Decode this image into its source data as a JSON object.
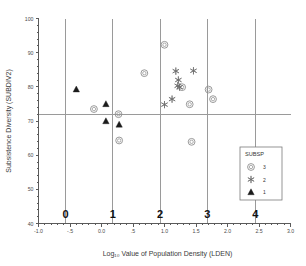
{
  "chart_data": {
    "type": "scatter",
    "title": "",
    "xlabel": "Log₁₀ Value of Population Density (LDEN)",
    "ylabel": "Subsistence Diversity (SUBDIV2)",
    "xlim": [
      -1.0,
      3.0
    ],
    "ylim": [
      40,
      100
    ],
    "grid": false,
    "xticklabels": [
      "-1.0",
      "-.5",
      "0.0",
      ".5",
      "1.0",
      "1.5",
      "2.0",
      "2.5",
      "3.0"
    ],
    "xtickvalues": [
      -1.0,
      -0.5,
      0.0,
      0.5,
      1.0,
      1.5,
      2.0,
      2.5,
      3.0
    ],
    "yticklabels": [
      "40",
      "50",
      "60",
      "70",
      "80",
      "90",
      "100"
    ],
    "ytickvalues": [
      40,
      50,
      60,
      70,
      80,
      90,
      100
    ],
    "reference_lines": {
      "horizontal": [
        72
      ],
      "vertical": [
        -0.57,
        0.18,
        0.93,
        1.68,
        2.44
      ]
    },
    "group_labels": [
      {
        "text": "0",
        "x": -0.57
      },
      {
        "text": "1",
        "x": 0.18
      },
      {
        "text": "2",
        "x": 0.93
      },
      {
        "text": "3",
        "x": 1.68
      },
      {
        "text": "4",
        "x": 2.44
      }
    ],
    "legend": {
      "title": "SUBSP",
      "position": "bottom-right",
      "entries": [
        {
          "label": "3",
          "marker": "circle"
        },
        {
          "label": "2",
          "marker": "asterisk"
        },
        {
          "label": "1",
          "marker": "triangle"
        }
      ]
    },
    "series": [
      {
        "name": "3",
        "marker": "circle",
        "color": "#8e8e8e",
        "points": [
          {
            "x": -0.12,
            "y": 73.5
          },
          {
            "x": 0.27,
            "y": 72.0
          },
          {
            "x": 0.28,
            "y": 64.3
          },
          {
            "x": 0.68,
            "y": 84.0
          },
          {
            "x": 1.0,
            "y": 92.3
          },
          {
            "x": 1.28,
            "y": 79.9
          },
          {
            "x": 1.4,
            "y": 74.9
          },
          {
            "x": 1.43,
            "y": 63.9
          },
          {
            "x": 1.7,
            "y": 79.2
          },
          {
            "x": 1.77,
            "y": 76.4
          }
        ]
      },
      {
        "name": "2",
        "marker": "asterisk",
        "color": "#6f6f6f",
        "points": [
          {
            "x": 1.0,
            "y": 74.8
          },
          {
            "x": 1.12,
            "y": 76.4
          },
          {
            "x": 1.18,
            "y": 84.6
          },
          {
            "x": 1.22,
            "y": 82.0
          },
          {
            "x": 1.21,
            "y": 80.3
          },
          {
            "x": 1.24,
            "y": 79.9
          },
          {
            "x": 1.46,
            "y": 84.7
          }
        ]
      },
      {
        "name": "1",
        "marker": "triangle",
        "color": "#1b1b1b",
        "points": [
          {
            "x": -0.4,
            "y": 79.3
          },
          {
            "x": 0.07,
            "y": 75.0
          },
          {
            "x": 0.07,
            "y": 70.0
          },
          {
            "x": 0.28,
            "y": 69.0
          }
        ]
      }
    ]
  }
}
